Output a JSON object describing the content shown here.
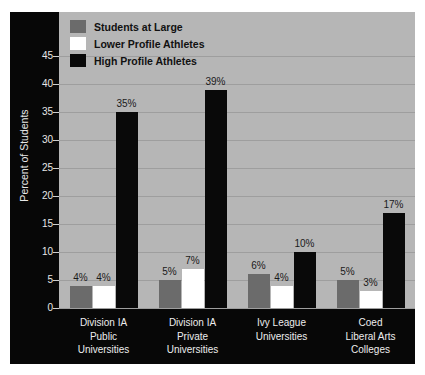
{
  "chart_data": {
    "type": "bar",
    "title": "",
    "xlabel": "",
    "ylabel": "Percent of Students",
    "ylim": [
      0,
      45
    ],
    "ytick_step": 5,
    "grid": true,
    "legend_position": "top-left",
    "value_suffix": "%",
    "categories": [
      "Division IA\nPublic\nUniversities",
      "Division IA\nPrivate\nUniversities",
      "Ivy League\nUniversities",
      "Coed\nLiberal Arts\nColleges"
    ],
    "yticks": [
      "0",
      "5",
      "10",
      "15",
      "20",
      "25",
      "30",
      "35",
      "40",
      "45"
    ],
    "series": [
      {
        "name": "Students at Large",
        "color": "#6b6b6b",
        "values": [
          4,
          5,
          6,
          5
        ],
        "labels": [
          "4%",
          "5%",
          "6%",
          "5%"
        ]
      },
      {
        "name": "Lower Profile Athletes",
        "color": "#ffffff",
        "values": [
          4,
          7,
          4,
          3
        ],
        "labels": [
          "4%",
          "7%",
          "4%",
          "3%"
        ]
      },
      {
        "name": "High Profile Athletes",
        "color": "#090909",
        "values": [
          35,
          39,
          10,
          17
        ],
        "labels": [
          "35%",
          "39%",
          "10%",
          "17%"
        ]
      }
    ]
  },
  "colors": {
    "panel_background": "#b6b6b6",
    "frame": "#070707",
    "gridline": "#9e9e9e",
    "axis_text": "#e8e8e8",
    "value_text": "#1a1a1a"
  }
}
